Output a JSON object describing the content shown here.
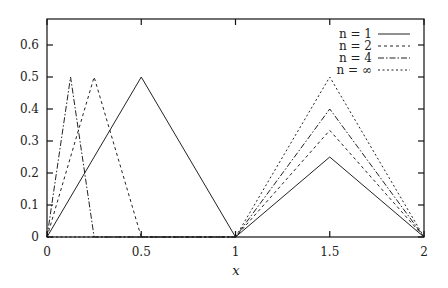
{
  "chart_data": {
    "type": "line",
    "title": "",
    "xlabel": "x",
    "ylabel": "",
    "xlim": [
      0,
      2
    ],
    "ylim": [
      0,
      0.68
    ],
    "xticks": [
      "0",
      "0.5",
      "1",
      "1.5",
      "2"
    ],
    "xtick_values": [
      0,
      0.5,
      1,
      1.5,
      2
    ],
    "yticks": [
      "0",
      "0.1",
      "0.2",
      "0.3",
      "0.4",
      "0.5",
      "0.6"
    ],
    "ytick_values": [
      0,
      0.1,
      0.2,
      0.3,
      0.4,
      0.5,
      0.6
    ],
    "grid": false,
    "legend_position": "upper right",
    "series": [
      {
        "name": "n = 1",
        "style": "solid",
        "x": [
          0,
          0.5,
          1,
          1.5,
          2
        ],
        "y": [
          0,
          0.5,
          0,
          0.25,
          0
        ]
      },
      {
        "name": "n = 2",
        "style": "dashed",
        "x": [
          0,
          0.25,
          0.5,
          1,
          1.5,
          2
        ],
        "y": [
          0,
          0.5,
          0,
          0,
          0.3333,
          0
        ]
      },
      {
        "name": "n = 4",
        "style": "dash-dot",
        "x": [
          0,
          0.125,
          0.25,
          1,
          1.5,
          2
        ],
        "y": [
          0,
          0.5,
          0,
          0,
          0.4,
          0
        ]
      },
      {
        "name": "n = ∞",
        "style": "dotted",
        "x": [
          0,
          1,
          1.5,
          2
        ],
        "y": [
          0,
          0,
          0.5,
          0
        ]
      }
    ]
  }
}
